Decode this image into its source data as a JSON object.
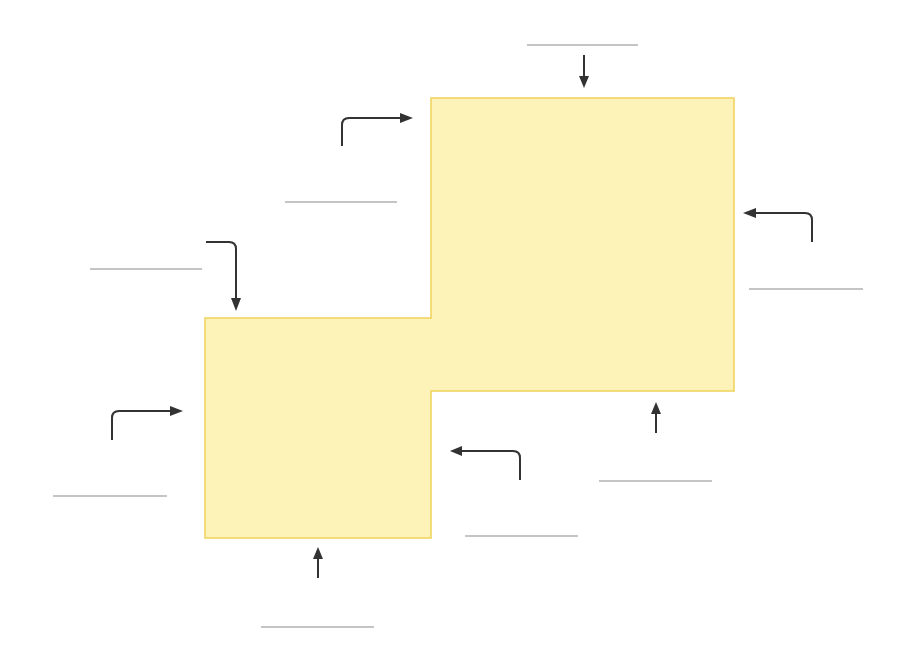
{
  "diagram": {
    "shape": {
      "fill": "#fdf3b8",
      "stroke": "#f0d25a",
      "points": [
        [
          431,
          98
        ],
        [
          734,
          98
        ],
        [
          734,
          391
        ],
        [
          431,
          391
        ],
        [
          431,
          538
        ],
        [
          205,
          538
        ],
        [
          205,
          318
        ],
        [
          431,
          318
        ]
      ]
    },
    "arrow_color": "#333333",
    "blank_color": "#8a8a8a",
    "blanks": [
      {
        "id": "top",
        "x1": 527,
        "y1": 45,
        "x2": 638,
        "y2": 45
      },
      {
        "id": "upper-left",
        "x1": 285,
        "y1": 202,
        "x2": 397,
        "y2": 202
      },
      {
        "id": "left-top",
        "x1": 90,
        "y1": 269,
        "x2": 202,
        "y2": 269
      },
      {
        "id": "right",
        "x1": 749,
        "y1": 289,
        "x2": 863,
        "y2": 289
      },
      {
        "id": "left-bottom",
        "x1": 53,
        "y1": 496,
        "x2": 167,
        "y2": 496
      },
      {
        "id": "lower-right",
        "x1": 599,
        "y1": 481,
        "x2": 712,
        "y2": 481
      },
      {
        "id": "inner-bottom",
        "x1": 465,
        "y1": 536,
        "x2": 578,
        "y2": 536
      },
      {
        "id": "bottom",
        "x1": 261,
        "y1": 627,
        "x2": 374,
        "y2": 627
      }
    ],
    "arrows": [
      {
        "id": "arrow-top-down",
        "d": "M584,55 L584,80",
        "head": [
          [
            584,
            88
          ],
          [
            579,
            76
          ],
          [
            589,
            76
          ]
        ]
      },
      {
        "id": "arrow-upper-left-right",
        "d": "M342,146 L342,125 Q342,118 349,118 L400,118",
        "head": [
          [
            413,
            118
          ],
          [
            400,
            113
          ],
          [
            400,
            123
          ]
        ]
      },
      {
        "id": "arrow-right-left",
        "d": "M812,242 L812,220 Q812,213 805,213 L756,213",
        "head": [
          [
            743,
            213
          ],
          [
            756,
            208
          ],
          [
            756,
            218
          ]
        ]
      },
      {
        "id": "arrow-left-top-down",
        "d": "M206,242 L229,242 Q236,242 236,249 L236,298",
        "head": [
          [
            236,
            311
          ],
          [
            231,
            298
          ],
          [
            241,
            298
          ]
        ]
      },
      {
        "id": "arrow-left-bottom-right",
        "d": "M112,440 L112,418 Q112,411 119,411 L170,411",
        "head": [
          [
            183,
            411
          ],
          [
            170,
            406
          ],
          [
            170,
            416
          ]
        ]
      },
      {
        "id": "arrow-inner-left",
        "d": "M520,480 L520,458 Q520,451 513,451 L462,451",
        "head": [
          [
            450,
            451
          ],
          [
            462,
            446
          ],
          [
            462,
            456
          ]
        ]
      },
      {
        "id": "arrow-lower-up",
        "d": "M656,433 L656,410",
        "head": [
          [
            656,
            402
          ],
          [
            651,
            414
          ],
          [
            661,
            414
          ]
        ]
      },
      {
        "id": "arrow-bottom-up",
        "d": "M318,578 L318,556",
        "head": [
          [
            318,
            547
          ],
          [
            313,
            559
          ],
          [
            323,
            559
          ]
        ]
      }
    ]
  }
}
